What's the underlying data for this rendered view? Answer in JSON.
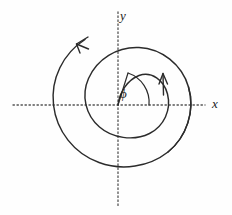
{
  "figure": {
    "kind": "polar-spiral-diagram",
    "width": 232,
    "height": 215,
    "background_color": "#fefefe",
    "ink_color": "#2b2b2b",
    "axis_color": "#555555"
  },
  "axes": {
    "x_label": "x",
    "y_label": "y",
    "style": "dotted",
    "origin": {
      "x": 118,
      "y": 105
    },
    "x_axis": {
      "start_x": 13,
      "end_x": 205,
      "y": 105
    },
    "y_axis": {
      "x": 118,
      "start_y": 12,
      "end_y": 207
    }
  },
  "angle_marker": {
    "symbol": "ϕ",
    "label": "ϕ",
    "vertex": {
      "x": 118,
      "y": 105
    },
    "ray_end": {
      "x": 128,
      "y": 73
    },
    "arc_radius": 31,
    "arc_from_deg": 0,
    "arc_to_deg": 72
  },
  "curve": {
    "name": "archimedean-spiral",
    "turns": 2,
    "description": "spiral starting at origin and winding outward counter-clockwise for two turns",
    "path": "M 118 105 C 120 92 128 78 140 74 C 153 70 166 80 169 95 C 173 113 165 128 150 135 C 133 143 112 139 100 128 C 86 116 82 96 89 79 C 97 60 117 47 139 48 C 162 49 183 65 189 87 C 196 111 187 137 168 152 C 149 167 122 171 99 163 C 74 154 56 131 53 105 C 50 79 63 53 85 39",
    "path_outer_tail": "M 169 95 C 173 113 165 128 150 135 C 133 143 112 139 100 128 C 86 116 82 96 89 79 C 97 60 117 47 139 48 C 162 49 183 65 189 87 C 196 111 187 137 168 152 C 149 167 122 171 99 163 C 74 154 56 131 53 105 C 50 79 63 53 85 39"
  },
  "arrows": [
    {
      "name": "direction-arrow-top-left",
      "tip": {
        "x": 77,
        "y": 44
      },
      "points": "counter-clockwise",
      "angle_deg": 200
    },
    {
      "name": "direction-arrow-right",
      "tip": {
        "x": 163,
        "y": 74
      },
      "points": "upward",
      "angle_deg": 275
    }
  ]
}
